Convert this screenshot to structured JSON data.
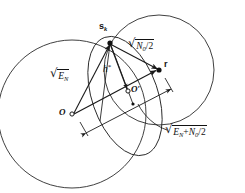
{
  "figure": {
    "background_color": "#ffffff",
    "stroke_color": "#1a1a1a",
    "width": 245,
    "height": 193
  },
  "points": [
    {
      "id": "O",
      "label": "O",
      "x": 72,
      "y": 114,
      "marker": "open-circle",
      "label_dx": -11,
      "label_dy": -4
    },
    {
      "id": "Oprime",
      "label": "O′",
      "x": 128,
      "y": 91,
      "marker": "open-circle",
      "label_dx": 3,
      "label_dy": -4
    },
    {
      "id": "sk",
      "label": "s",
      "sublabel": "k",
      "x": 110,
      "y": 43,
      "marker": "filled-dot",
      "label_dx": -9,
      "label_dy": -14
    },
    {
      "id": "r",
      "label": "r",
      "x": 159,
      "y": 70,
      "marker": "filled-dot",
      "label_dx": 4,
      "label_dy": -9
    },
    {
      "id": "small_circle_center",
      "label": "",
      "x": 133,
      "y": 103,
      "marker": "filled-dot-small",
      "label_dx": 0,
      "label_dy": 0
    }
  ],
  "circles": [
    {
      "id": "circle-EN",
      "name": "circle-centered-at-O",
      "cx": 72,
      "cy": 114,
      "r": 74,
      "description": "Large circle of radius sqrt(E_N) centred on O, passing through s_k"
    },
    {
      "id": "circle-N0",
      "name": "circle-centered-at-r",
      "cx": 159,
      "cy": 70,
      "r": 55,
      "description": "Circle of radius sqrt(N0/2) centred on r, passing through s_k"
    },
    {
      "id": "circle-small",
      "name": "small-circle-through-sk-and-Oprime",
      "cx": 133,
      "cy": 103,
      "r": 63,
      "rx": 34,
      "ry": 63,
      "rotation": -22,
      "description": "Small circle through s_k and O prime"
    }
  ],
  "segments": [
    {
      "id": "seg-O-sk",
      "name": "segment-O-to-sk",
      "x1": 72,
      "y1": 114,
      "x2": 110,
      "y2": 43,
      "arrow": true,
      "label_ref": "sqrt_EN"
    },
    {
      "id": "seg-sk-r",
      "name": "segment-sk-to-r",
      "x1": 110,
      "y1": 43,
      "x2": 159,
      "y2": 70,
      "arrow": true,
      "label_ref": "sqrt_N0_2"
    },
    {
      "id": "seg-sk-Op",
      "name": "segment-sk-to-Oprime",
      "x1": 110,
      "y1": 43,
      "x2": 128,
      "y2": 91,
      "arrow": true,
      "label_ref": "h_star"
    },
    {
      "id": "seg-O-r",
      "name": "segment-O-to-r",
      "x1": 72,
      "y1": 114,
      "x2": 159,
      "y2": 70,
      "arrow": true,
      "label_ref": null
    },
    {
      "id": "seg-sk-dn",
      "name": "segment-sk-downward",
      "x1": 110,
      "y1": 43,
      "x2": 101,
      "y2": 118,
      "arrow": false,
      "label_ref": null
    },
    {
      "id": "seg-sk-dn2",
      "name": "segment-sk-downward-2",
      "x1": 110,
      "y1": 43,
      "x2": 120,
      "y2": 120,
      "arrow": false,
      "label_ref": null
    }
  ],
  "dimension_line": {
    "id": "dim-EN-plus-N0",
    "name": "dimension-O-to-r",
    "x1": 83,
    "y1": 131,
    "x2": 170,
    "y2": 87,
    "style": "double-headed-arrow",
    "tick_style": "perpendicular-end-ticks",
    "label_ref": "sqrt_EN_plus_N0_2"
  },
  "leader": {
    "id": "leader-to-dimension",
    "name": "leader-line-to-dimension-label",
    "from_x": 176,
    "from_y": 131,
    "to_x": 150,
    "to_y": 103,
    "description": "Curved leader from the sqrt(E_N + N0/2) label up to the dimension arrow"
  },
  "labels": {
    "sqrt_EN": {
      "id": "label-sqrt-EN",
      "name": "label-sqrt-EN",
      "radical_sign": "√",
      "base": "E",
      "sub": "N",
      "full_text": "√(E_N)",
      "x": 53,
      "y": 73
    },
    "sqrt_N0_2": {
      "id": "label-sqrt-N0-over-2",
      "name": "label-sqrt-N0-over-2",
      "radical_sign": "√",
      "base": "N",
      "sub": "0",
      "denom": "/2",
      "full_text": "√(N₀/2)",
      "x": 129,
      "y": 42
    },
    "sqrt_EN_plus_N0_2": {
      "id": "label-sqrt-EN-plus-N0-over-2",
      "name": "label-sqrt-EN-plus-N0-over-2",
      "radical_sign": "√",
      "term1_base": "E",
      "term1_sub": "N",
      "operator": "+",
      "term2_base": "N",
      "term2_sub": "0",
      "denom": "/2",
      "full_text": "√(E_N + N₀/2)",
      "x": 168,
      "y": 128
    },
    "h_star": {
      "id": "label-h-star",
      "name": "label-h-star",
      "base": "h",
      "sup": "*",
      "full_text": "h*",
      "x": 104,
      "y": 66
    },
    "point_O": {
      "id": "label-O",
      "name": "label-point-O",
      "text": "O",
      "x": 60,
      "y": 108
    },
    "point_Oprime": {
      "id": "label-O-prime",
      "name": "label-point-O-prime",
      "text": "O′",
      "x": 131,
      "y": 85
    },
    "point_sk": {
      "id": "label-sk",
      "name": "label-point-sk",
      "text": "s",
      "sub": "k",
      "full_text": "sₖ",
      "x": 101,
      "y": 25
    },
    "point_r": {
      "id": "label-r",
      "name": "label-point-r",
      "text": "r",
      "x": 164,
      "y": 60
    }
  }
}
